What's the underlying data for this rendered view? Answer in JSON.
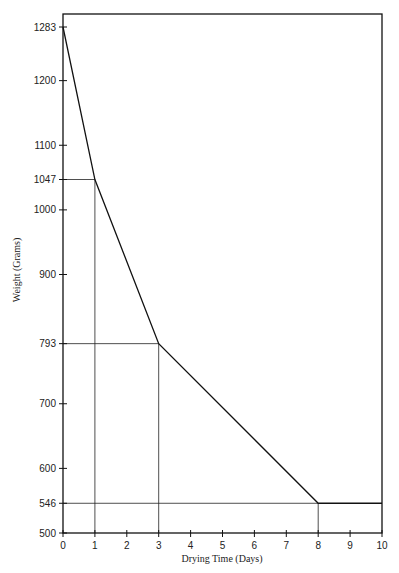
{
  "chart_data": {
    "type": "line",
    "title": "",
    "xlabel": "Drying Time (Days)",
    "ylabel": "Weight (Grams)",
    "xlim": [
      0,
      10
    ],
    "ylim": [
      500,
      1283
    ],
    "x_ticks": [
      "0",
      "1",
      "2",
      "3",
      "4",
      "5",
      "6",
      "7",
      "8",
      "9",
      "10"
    ],
    "y_ticks": [
      "500",
      "546",
      "600",
      "700",
      "793",
      "900",
      "1000",
      "1047",
      "1100",
      "1200",
      "1283"
    ],
    "grid": false,
    "series": [
      {
        "name": "Weight",
        "x": [
          0,
          1,
          3,
          8,
          10
        ],
        "values": [
          1283,
          1047,
          793,
          546,
          546
        ]
      }
    ],
    "reference_lines": [
      {
        "x": 1,
        "y": 1047
      },
      {
        "x": 3,
        "y": 793
      },
      {
        "x": 8,
        "y": 546
      }
    ]
  }
}
